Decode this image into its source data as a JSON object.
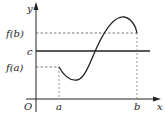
{
  "diagram": {
    "type": "function-graph",
    "axes": {
      "x_label": "x",
      "y_label": "y",
      "origin_label": "O"
    },
    "x_ticks": [
      {
        "label": "a",
        "x": 59
      },
      {
        "label": "b",
        "x": 137
      }
    ],
    "y_labels": [
      {
        "label": "f(b)",
        "y": 33
      },
      {
        "label": "c",
        "y": 51
      },
      {
        "label": "f(a)",
        "y": 67
      }
    ],
    "horizontal_line_label": "c",
    "curve_description": "continuous curve from (a, f(a)) dipping to a minimum, rising through y=c, reaching a maximum, then descending to (b, f(b))",
    "colors": {
      "stroke": "#222222",
      "dashed": "#555555"
    }
  },
  "labels": {
    "y": "y",
    "x": "x",
    "origin": "O",
    "a": "a",
    "b": "b",
    "fb": "f(b)",
    "c": "c",
    "fa": "f(a)"
  }
}
